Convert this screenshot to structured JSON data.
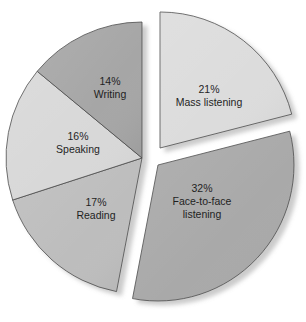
{
  "chart_data": {
    "type": "pie",
    "title": "",
    "xlabel": "",
    "ylabel": "",
    "legend": null,
    "start_angle_deg": 0,
    "direction": "clockwise",
    "center": [
      142,
      158
    ],
    "radius": 136,
    "unit": "%",
    "categories": [
      "Mass listening",
      "Face-to-face listening",
      "Reading",
      "Speaking",
      "Writing"
    ],
    "values": [
      21,
      32,
      17,
      16,
      14
    ],
    "slices": [
      {
        "label": "Mass listening",
        "value": 21,
        "display": "21%",
        "label_lines": [
          "21%",
          "Mass listening"
        ],
        "color": "#dcdcdc",
        "exploded": true,
        "offset": [
          18,
          -10
        ]
      },
      {
        "label": "Face-to-face listening",
        "value": 32,
        "display": "32%",
        "label_lines": [
          "32%",
          "Face-to-face",
          "listening"
        ],
        "color": "#a9a9a9",
        "exploded": true,
        "offset": [
          16,
          7
        ]
      },
      {
        "label": "Reading",
        "value": 17,
        "display": "17%",
        "label_lines": [
          "17%",
          "Reading"
        ],
        "color": "#bdbdbd",
        "exploded": false,
        "offset": [
          0,
          0
        ]
      },
      {
        "label": "Speaking",
        "value": 16,
        "display": "16%",
        "label_lines": [
          "16%",
          "Speaking"
        ],
        "color": "#d8d8d8",
        "exploded": false,
        "offset": [
          0,
          0
        ]
      },
      {
        "label": "Writing",
        "value": 14,
        "display": "14%",
        "label_lines": [
          "14%",
          "Writing"
        ],
        "color": "#a6a6a6",
        "exploded": false,
        "offset": [
          0,
          0
        ]
      }
    ]
  }
}
